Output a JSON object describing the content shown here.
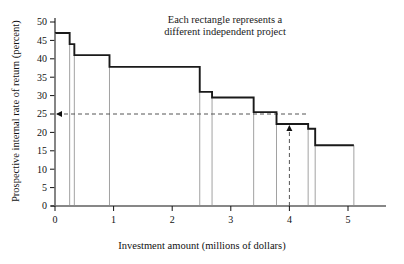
{
  "chart_data": {
    "type": "bar",
    "title": "",
    "annotation_lines": [
      "Each rectangle represents a",
      "different independent project"
    ],
    "xlabel": "Investment amount (millions of dollars)",
    "ylabel": "Prospective internal rate of return (percent)",
    "xlim": [
      0,
      5.6
    ],
    "ylim": [
      0,
      52
    ],
    "xticks": [
      0,
      1,
      2,
      3,
      4,
      5
    ],
    "xticklabels": [
      "0",
      "1",
      "2",
      "3",
      "4",
      "5"
    ],
    "yticks": [
      0,
      5,
      10,
      15,
      20,
      25,
      30,
      35,
      40,
      45,
      50
    ],
    "yticklabels": [
      "0",
      "5",
      "10",
      "15",
      "20",
      "25",
      "30",
      "35",
      "40",
      "45",
      "50"
    ],
    "grid": false,
    "legend": "none",
    "series_name": "Prospective internal rate of return",
    "step_edges": [
      0,
      0.25,
      0.33,
      0.93,
      2.47,
      2.68,
      3.39,
      3.78,
      4.32,
      4.44,
      5.1
    ],
    "values": [
      47,
      44,
      41,
      37.8,
      31,
      29.5,
      25.5,
      22.3,
      21,
      16.5
    ],
    "bars": [
      {
        "x_start": 0,
        "x_end": 0.25,
        "value": 47
      },
      {
        "x_start": 0.25,
        "x_end": 0.33,
        "value": 44
      },
      {
        "x_start": 0.33,
        "x_end": 0.93,
        "value": 41
      },
      {
        "x_start": 0.93,
        "x_end": 2.47,
        "value": 37.8
      },
      {
        "x_start": 2.47,
        "x_end": 2.68,
        "value": 31
      },
      {
        "x_start": 2.68,
        "x_end": 3.39,
        "value": 29.5
      },
      {
        "x_start": 3.39,
        "x_end": 3.78,
        "value": 25.5
      },
      {
        "x_start": 3.78,
        "x_end": 4.32,
        "value": 22.3
      },
      {
        "x_start": 4.32,
        "x_end": 4.44,
        "value": 21
      },
      {
        "x_start": 4.44,
        "x_end": 5.1,
        "value": 16.5
      }
    ],
    "reference_line": {
      "axis": "y",
      "value": 25,
      "style": "dashed",
      "arrow": "left"
    },
    "marker_line": {
      "axis": "x",
      "value": 4.0,
      "style": "dashed",
      "arrow": "up",
      "top_value": 22.3
    },
    "colors": {
      "step_line": "#1a1a1a",
      "bar_edge": "#8a8a8a",
      "dashed": "#555555",
      "axis": "#111111"
    }
  }
}
